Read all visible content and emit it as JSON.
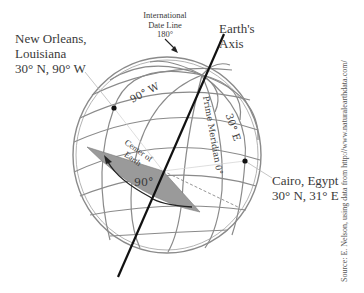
{
  "labels": {
    "new_orleans": {
      "name_line1": "New Orleans,",
      "name_line2": "Louisiana",
      "coords": "30° N, 90° W"
    },
    "cairo": {
      "name": "Cairo, Egypt",
      "coords": "30° N, 31° E"
    },
    "date_line": {
      "line1": "International",
      "line2": "Date Line",
      "line3": "180°"
    },
    "earth_axis": {
      "line1": "Earth's",
      "line2": "Axis"
    },
    "meridian_90w": "90° W",
    "meridian_30e": "30° E",
    "prime_meridian": "Prime Meridian 0°",
    "center_of_earth": {
      "line1": "Center of",
      "line2": "Earth"
    },
    "angle": "90°",
    "source": "Source: E. Nelson, using data from http://www.naturalearthdata.com/"
  },
  "colors": {
    "grid": "#8a8a8a",
    "axis": "#111111",
    "wedge": "#9a9a9a",
    "text": "#3a3a3a",
    "dot": "#111111"
  }
}
